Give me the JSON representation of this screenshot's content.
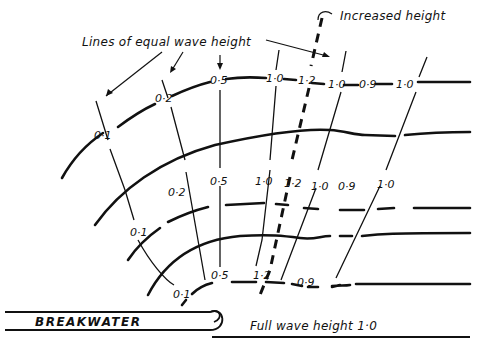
{
  "annotations": {
    "lines_of_equal_height": "Lines of equal  wave height",
    "increased_height": "Increased height",
    "breakwater": "BREAKWATER",
    "full_wave_height": "Full wave height  1·0"
  },
  "crest_labels": {
    "row1": [
      "0·1",
      "0·2",
      "0·5",
      "1·0",
      "1·2",
      "1·0",
      "0·9",
      "1·0"
    ],
    "row2": [
      "0·1",
      "0·2",
      "0·5",
      "1·0",
      "1·2",
      "1·0",
      "0·9",
      "1·0"
    ],
    "row3": [
      "0·1",
      "0·5",
      "1·2",
      "0·9"
    ]
  },
  "contour_values": [
    0.1,
    0.2,
    0.5,
    1.0,
    1.2,
    1.0,
    0.9,
    1.0
  ],
  "colors": {
    "ink": "#111111",
    "paper": "#ffffff"
  }
}
